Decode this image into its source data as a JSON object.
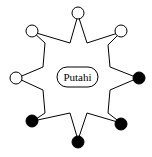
{
  "diagram": {
    "center_label": "Putahi",
    "colors": {
      "stroke": "#000000",
      "open_fill": "#ffffff",
      "filled_fill": "#000000"
    },
    "nodes": [
      {
        "position": "top",
        "state": "open"
      },
      {
        "position": "top-right",
        "state": "open"
      },
      {
        "position": "right",
        "state": "filled"
      },
      {
        "position": "bottom-right",
        "state": "filled"
      },
      {
        "position": "bottom",
        "state": "filled"
      },
      {
        "position": "bottom-left",
        "state": "filled"
      },
      {
        "position": "left",
        "state": "open"
      },
      {
        "position": "top-left",
        "state": "open"
      }
    ],
    "node_count": 8,
    "open_count": 4,
    "filled_count": 4
  }
}
